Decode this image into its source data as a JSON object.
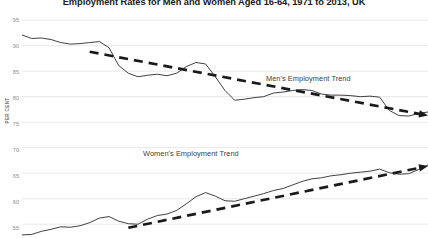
{
  "chart_title": "Employment Rates for Men and Women Aged 16-64, 1971 to 2013, UK",
  "axis": {
    "y_label": "PER CENT",
    "y_ticks": [
      "95",
      "90",
      "85",
      "80",
      "75",
      "70",
      "65",
      "60",
      "55"
    ]
  },
  "annotations": {
    "men_trend": "Men's Employment Trend",
    "women_trend": "Women's Employment Trend"
  },
  "colors": {
    "series_line": "#2b2b2b",
    "trend_line": "#1a1a1a",
    "gridline": "#e2e2e2",
    "tick_text": "#8c8c8c",
    "title_text": "#1a1a1a",
    "background": "#ffffff"
  },
  "chart_data": {
    "type": "line",
    "title": "Employment Rates for Men and Women Aged 16-64, 1971 to 2013, UK",
    "xlabel": "",
    "ylabel": "PER CENT",
    "ylim": [
      52.3,
      96.2
    ],
    "xlim": [
      1971,
      2013
    ],
    "grid": true,
    "grid_axis": "y",
    "legend": "none",
    "yticks": [
      95,
      90,
      85,
      80,
      75,
      70,
      65,
      60,
      55
    ],
    "x": [
      1971,
      1972,
      1973,
      1974,
      1975,
      1976,
      1977,
      1978,
      1979,
      1980,
      1981,
      1982,
      1983,
      1984,
      1985,
      1986,
      1987,
      1988,
      1989,
      1990,
      1991,
      1992,
      1993,
      1994,
      1995,
      1996,
      1997,
      1998,
      1999,
      2000,
      2001,
      2002,
      2003,
      2004,
      2005,
      2006,
      2007,
      2008,
      2009,
      2010,
      2011,
      2012,
      2013
    ],
    "series": [
      {
        "name": "Men's employment rate",
        "style": "solid",
        "values": [
          92.1,
          91.4,
          91.5,
          91.2,
          90.6,
          90.3,
          90.4,
          90.6,
          90.8,
          89.6,
          86.1,
          84.6,
          83.9,
          84.2,
          84.4,
          84.1,
          84.6,
          85.9,
          86.7,
          86.4,
          83.9,
          81.2,
          79.3,
          79.5,
          79.8,
          80.0,
          80.7,
          80.9,
          81.2,
          81.4,
          81.2,
          80.5,
          80.3,
          80.3,
          80.2,
          80.0,
          80.1,
          79.9,
          77.3,
          76.3,
          76.2,
          76.7,
          77.0
        ]
      },
      {
        "name": "Women's employment rate",
        "style": "solid",
        "values": [
          52.9,
          53.0,
          53.6,
          54.0,
          54.5,
          54.4,
          54.7,
          55.3,
          56.2,
          56.5,
          55.6,
          55.1,
          55.0,
          56.0,
          56.7,
          57.0,
          57.7,
          59.0,
          60.4,
          61.2,
          60.5,
          59.6,
          59.5,
          60.0,
          60.5,
          61.0,
          61.6,
          62.0,
          62.7,
          63.4,
          63.9,
          64.1,
          64.5,
          64.7,
          65.0,
          65.2,
          65.4,
          65.8,
          65.1,
          64.8,
          64.9,
          65.7,
          66.6
        ]
      }
    ],
    "trend_annotations": [
      {
        "label": "Men's Employment Trend",
        "style": "dashed-arrow",
        "from": [
          1978,
          88.8
        ],
        "to": [
          2013,
          76.3
        ],
        "direction": "declining"
      },
      {
        "label": "Women's Employment Trend",
        "style": "dashed-arrow",
        "from": [
          1982,
          54.3
        ],
        "to": [
          2013,
          66.4
        ],
        "direction": "rising"
      }
    ]
  }
}
